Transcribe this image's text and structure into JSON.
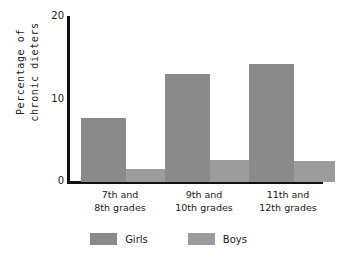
{
  "chart_data": {
    "type": "bar",
    "title": "",
    "xlabel": "",
    "ylabel": "Percentage of chronic dieters",
    "ylabel_line1": "Percentage of",
    "ylabel_line2": "chronic dieters",
    "categories": [
      "7th and 8th grades",
      "9th and 10th grades",
      "11th and 12th grades"
    ],
    "category_lines": [
      [
        "7th and",
        "8th grades"
      ],
      [
        "9th and",
        "10th grades"
      ],
      [
        "11th and",
        "12th grades"
      ]
    ],
    "series": [
      {
        "name": "Girls",
        "values": [
          7.7,
          13.0,
          14.2
        ],
        "color": "#8a8a8a"
      },
      {
        "name": "Boys",
        "values": [
          1.6,
          2.7,
          2.5
        ],
        "color": "#9c9c9c"
      }
    ],
    "ylim": [
      0,
      20
    ],
    "yticks": [
      0,
      10,
      20
    ],
    "ytick_labels": [
      "0",
      "10",
      "20"
    ],
    "grid": false,
    "legend_position": "bottom",
    "axis_color": "#111111",
    "background": "#ffffff"
  },
  "axis": {
    "tick_0": "0",
    "tick_10": "10",
    "tick_20": "20"
  },
  "legend": {
    "items": [
      {
        "label": "Girls"
      },
      {
        "label": "Boys"
      }
    ]
  }
}
